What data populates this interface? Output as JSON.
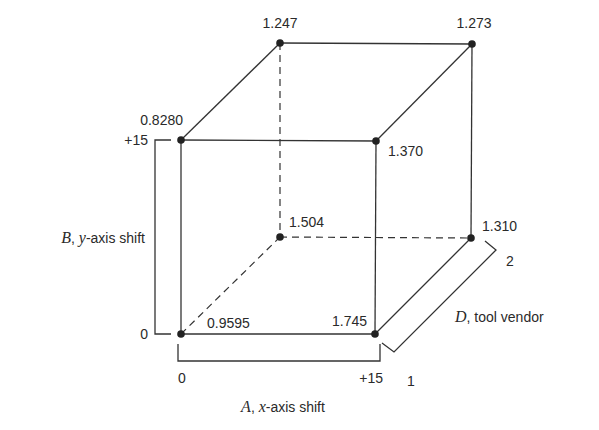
{
  "diagram": {
    "type": "cube-design-of-experiments",
    "vertices": {
      "front_bottom_left": "0.9595",
      "front_bottom_right": "1.745",
      "front_top_left": "0.8280",
      "front_top_right": "1.370",
      "back_bottom_left": "1.504",
      "back_bottom_right": "1.310",
      "back_top_left": "1.247",
      "back_top_right": "1.273"
    },
    "axes": {
      "A": {
        "variable": "A",
        "label": ", x-axis shift",
        "var_x": "x",
        "suffix": "-axis shift",
        "low": "0",
        "high": "+15"
      },
      "B": {
        "variable": "B",
        "var_y": "y",
        "suffix": "-axis shift",
        "low": "0",
        "high": "+15"
      },
      "D": {
        "variable": "D",
        "suffix": ", tool vendor",
        "low": "1",
        "high": "2"
      }
    }
  }
}
